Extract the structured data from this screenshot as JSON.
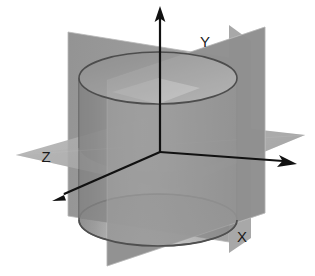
{
  "figure": {
    "background_color": "#ffffff"
  },
  "labels": {
    "y": "Y",
    "z": "Z",
    "x": "X"
  },
  "axes": [
    {
      "name": "vertical-up-axis",
      "label": "Y",
      "direction": "up",
      "tip": [
        160,
        8
      ],
      "tail": [
        160,
        152
      ]
    },
    {
      "name": "right-axis",
      "label": "X",
      "direction": "right-down",
      "tip": [
        297,
        164
      ],
      "tail": [
        160,
        152
      ]
    },
    {
      "name": "left-front-axis",
      "label": "Z",
      "direction": "left-down",
      "tip": [
        52,
        201
      ],
      "tail": [
        160,
        152
      ]
    }
  ],
  "planes": [
    {
      "name": "back-vertical-plane",
      "orientation": "vertical-back",
      "fill": "#8d8d8d",
      "opacity": 0.85
    },
    {
      "name": "front-vertical-plane",
      "orientation": "vertical-front",
      "fill": "#8d8d8d",
      "opacity": 0.7
    },
    {
      "name": "horizontal-plane",
      "orientation": "horizontal",
      "fill": "#a8a8a8",
      "opacity": 0.75
    }
  ],
  "cylinder": {
    "name": "translucent-cylinder",
    "top_center": [
      158,
      78
    ],
    "bottom_center": [
      158,
      220
    ],
    "radius_x": 79,
    "radius_y": 26,
    "fill_light": "#f2f2f2",
    "fill_mid": "#b4b4b4",
    "fill_dark": "#7a7a7a",
    "stroke": "#4a4a4a",
    "opacity": 0.6
  },
  "colors": {
    "ink": "#1a1a1a",
    "plane_gray": "#8d8d8d",
    "plane_light_gray": "#a8a8a8",
    "cylinder_highlight": "#f2f2f2",
    "cylinder_shadow": "#707070",
    "outline": "#4a4a4a"
  }
}
